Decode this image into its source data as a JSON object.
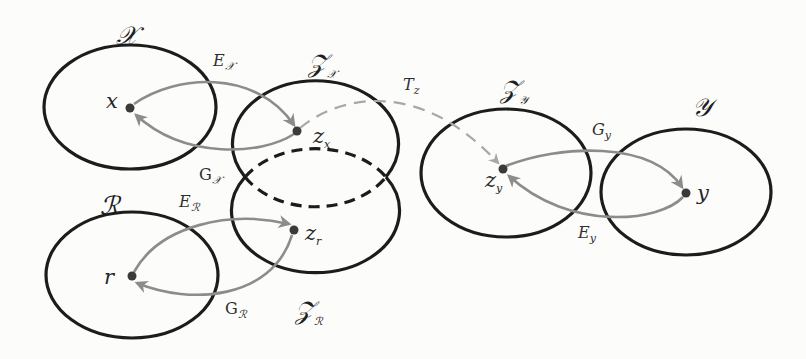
{
  "diagram": {
    "colors": {
      "ellipse_stroke": "#1c1c1c",
      "mapping_arrow": "#8c8c8c",
      "transform_arrow": "#a8a8a8",
      "point_fill": "#3a3a3a",
      "background": "#fcfcfb"
    },
    "spaces": [
      {
        "id": "X",
        "name": "𝒳",
        "sub": "",
        "style": "solid",
        "cx": 130,
        "cy": 107,
        "rx": 86,
        "ry": 62
      },
      {
        "id": "Zx",
        "name": "𝒵",
        "sub": "𝒳",
        "style": "solid",
        "cx": 315,
        "cy": 140,
        "rx": 83,
        "ry": 63
      },
      {
        "id": "R",
        "name": "ℛ",
        "sub": "",
        "style": "solid",
        "cx": 132,
        "cy": 275,
        "rx": 86,
        "ry": 63
      },
      {
        "id": "Zr",
        "name": "𝒵",
        "sub": "ℛ",
        "style": "solid",
        "cx": 312,
        "cy": 221,
        "rx": 84,
        "ry": 62
      },
      {
        "id": "Zy",
        "name": "𝒵",
        "sub": "𝒴",
        "style": "solid",
        "cx": 506,
        "cy": 173,
        "rx": 85,
        "ry": 64
      },
      {
        "id": "Y",
        "name": "𝒴",
        "sub": "",
        "style": "solid",
        "cx": 686,
        "cy": 192,
        "rx": 85,
        "ry": 63
      }
    ],
    "overlap": {
      "label": "shared latent region Z_X ∩ Z_R",
      "style": "dashed"
    },
    "points": [
      {
        "id": "x",
        "name": "x",
        "sub": "",
        "cx": 130,
        "cy": 108
      },
      {
        "id": "zx",
        "name": "z",
        "sub": "x",
        "cx": 297,
        "cy": 131
      },
      {
        "id": "r",
        "name": "r",
        "sub": "",
        "cx": 132,
        "cy": 276
      },
      {
        "id": "zr",
        "name": "z",
        "sub": "r",
        "cx": 294,
        "cy": 230
      },
      {
        "id": "zy",
        "name": "z",
        "sub": "y",
        "cx": 503,
        "cy": 169
      },
      {
        "id": "y",
        "name": "y",
        "sub": "",
        "cx": 686,
        "cy": 193
      }
    ],
    "mappings": [
      {
        "id": "Ex",
        "name": "E",
        "sub": "𝒳",
        "italic": true,
        "from": "x",
        "to": "zx",
        "kind": "encoder"
      },
      {
        "id": "Gx",
        "name": "G",
        "sub": "𝒳",
        "italic": false,
        "from": "zx",
        "to": "x",
        "kind": "generator"
      },
      {
        "id": "ER",
        "name": "E",
        "sub": "ℛ",
        "italic": true,
        "from": "r",
        "to": "zr",
        "kind": "encoder"
      },
      {
        "id": "GR",
        "name": "G",
        "sub": "ℛ",
        "italic": false,
        "from": "zr",
        "to": "r",
        "kind": "generator"
      },
      {
        "id": "Tz",
        "name": "T",
        "sub": "z",
        "italic": true,
        "from": "zx",
        "to": "zy",
        "kind": "latent-transform"
      },
      {
        "id": "Gy",
        "name": "G",
        "sub": "y",
        "italic": true,
        "from": "zy",
        "to": "y",
        "kind": "generator"
      },
      {
        "id": "Ey",
        "name": "E",
        "sub": "y",
        "italic": true,
        "from": "y",
        "to": "zy",
        "kind": "encoder"
      }
    ]
  }
}
